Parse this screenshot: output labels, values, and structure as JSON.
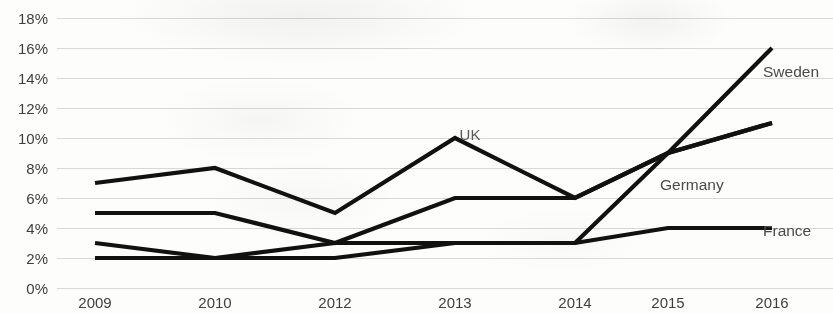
{
  "chart_data": {
    "type": "line",
    "title": "",
    "subtitle": "",
    "xlabel": "",
    "ylabel": "",
    "categories": [
      "2009",
      "2010",
      "2012",
      "2013",
      "2014",
      "2015",
      "2016"
    ],
    "x_tick_labels": [
      "2009",
      "2010",
      "2012",
      "2013",
      "2014",
      "2015",
      "2016"
    ],
    "y_tick_labels": [
      "0%",
      "2%",
      "4%",
      "6%",
      "8%",
      "10%",
      "12%",
      "14%",
      "16%",
      "18%"
    ],
    "y_tick_values": [
      0,
      2,
      4,
      6,
      8,
      10,
      12,
      14,
      16,
      18
    ],
    "ylim": [
      0,
      18
    ],
    "y_unit": "%",
    "grid": true,
    "grid_axis": "y",
    "legend_position": "inline-right",
    "series": [
      {
        "name": "UK",
        "label_position": "inline",
        "color": "#111111",
        "values": [
          7,
          8,
          5,
          10,
          6,
          9,
          11
        ]
      },
      {
        "name": "Germany",
        "label_position": "right",
        "color": "#111111",
        "values": [
          5,
          5,
          3,
          6,
          6,
          9,
          11
        ]
      },
      {
        "name": "France",
        "label_position": "right",
        "color": "#111111",
        "values": [
          3,
          2,
          2,
          3,
          3,
          4,
          4
        ]
      },
      {
        "name": "Sweden",
        "label_position": "right",
        "color": "#111111",
        "values": [
          2,
          2,
          3,
          3,
          3,
          9,
          16
        ]
      }
    ],
    "annotations": [
      {
        "text": "UK",
        "near_category": "2013",
        "near_value": 10
      },
      {
        "text": "Sweden",
        "near_category": "2016",
        "near_value": 16
      },
      {
        "text": "Germany",
        "near_category": "2016",
        "near_value": 11
      },
      {
        "text": "France",
        "near_category": "2016",
        "near_value": 4
      }
    ]
  },
  "axis": {
    "y_labels": [
      "18%",
      "16%",
      "14%",
      "12%",
      "10%",
      "8%",
      "6%",
      "4%",
      "2%",
      "0%"
    ],
    "x_labels": [
      "2009",
      "2010",
      "2012",
      "2013",
      "2014",
      "2015",
      "2016"
    ]
  },
  "labels": {
    "uk": "UK",
    "sweden": "Sweden",
    "germany": "Germany",
    "france": "France"
  }
}
